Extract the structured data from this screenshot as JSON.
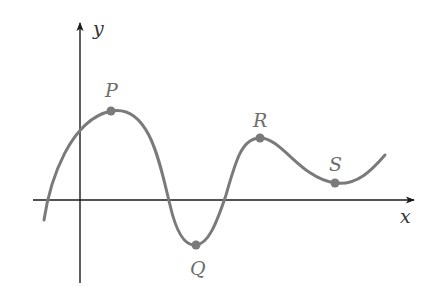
{
  "figure": {
    "axes": {
      "x_label": "x",
      "y_label": "y"
    },
    "points": [
      {
        "label": "P",
        "kind": "local maximum"
      },
      {
        "label": "Q",
        "kind": "local minimum"
      },
      {
        "label": "R",
        "kind": "local maximum"
      },
      {
        "label": "S",
        "kind": "local minimum"
      }
    ],
    "colors": {
      "axis": "#1a1a1a",
      "curve": "#7a7a7a",
      "point_labels": "#6e6e6e"
    }
  }
}
